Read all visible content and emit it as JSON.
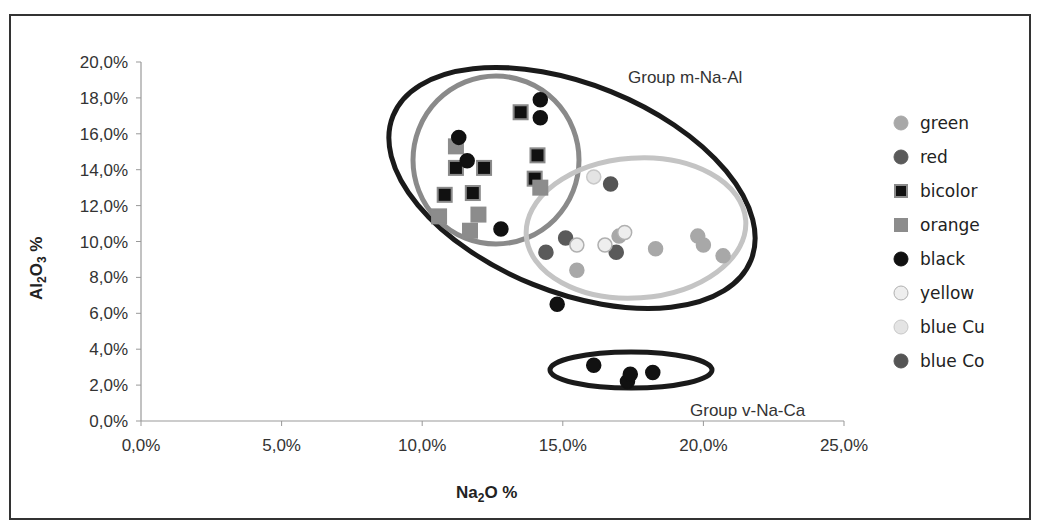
{
  "chart_data": {
    "type": "scatter",
    "title": "",
    "xlabel": "Na2O %",
    "ylabel": "Al2O3 %",
    "xlim": [
      0,
      25
    ],
    "ylim": [
      0,
      20
    ],
    "x_ticks": [
      "0,0%",
      "5,0%",
      "10,0%",
      "15,0%",
      "20,0%",
      "25,0%"
    ],
    "y_ticks": [
      "0,0%",
      "2,0%",
      "4,0%",
      "6,0%",
      "8,0%",
      "10,0%",
      "12,0%",
      "14,0%",
      "16,0%",
      "18,0%",
      "20,0%"
    ],
    "grid": false,
    "legend_position": "right",
    "series": [
      {
        "name": "green",
        "marker": "circle",
        "color": "#a8a8a8",
        "stroke": "#a8a8a8",
        "points": [
          [
            15.5,
            8.4
          ],
          [
            18.3,
            9.6
          ],
          [
            19.8,
            10.3
          ],
          [
            20.0,
            9.8
          ],
          [
            20.7,
            9.2
          ],
          [
            17.0,
            10.3
          ]
        ]
      },
      {
        "name": "red",
        "marker": "circle",
        "color": "#5a5a5a",
        "stroke": "#5a5a5a",
        "points": [
          [
            14.4,
            9.4
          ],
          [
            15.1,
            10.2
          ],
          [
            16.9,
            9.4
          ]
        ]
      },
      {
        "name": "bicolor",
        "marker": "square",
        "color": "#111111",
        "stroke": "#8a8a8a",
        "points": [
          [
            13.5,
            17.2
          ],
          [
            11.2,
            14.1
          ],
          [
            12.2,
            14.1
          ],
          [
            10.8,
            12.6
          ],
          [
            11.8,
            12.7
          ],
          [
            14.1,
            14.8
          ],
          [
            14.0,
            13.5
          ]
        ]
      },
      {
        "name": "orange",
        "marker": "square",
        "color": "#8c8c8c",
        "stroke": "#8c8c8c",
        "points": [
          [
            11.2,
            15.3
          ],
          [
            10.6,
            11.4
          ],
          [
            12.0,
            11.5
          ],
          [
            11.7,
            10.6
          ],
          [
            14.2,
            13.0
          ]
        ]
      },
      {
        "name": "black",
        "marker": "circle",
        "color": "#111111",
        "stroke": "#111111",
        "points": [
          [
            14.2,
            17.9
          ],
          [
            14.2,
            16.9
          ],
          [
            11.3,
            15.8
          ],
          [
            11.6,
            14.5
          ],
          [
            12.8,
            10.7
          ],
          [
            14.8,
            6.5
          ],
          [
            16.1,
            3.1
          ],
          [
            17.3,
            2.2
          ],
          [
            17.4,
            2.6
          ],
          [
            18.2,
            2.7
          ]
        ]
      },
      {
        "name": "yellow",
        "marker": "circle",
        "color": "#eeeeee",
        "stroke": "#b0b0b0",
        "points": [
          [
            15.5,
            9.8
          ],
          [
            16.5,
            9.8
          ],
          [
            17.2,
            10.5
          ]
        ]
      },
      {
        "name": "blue Cu",
        "marker": "circle",
        "color": "#e4e4e4",
        "stroke": "#c8c8c8",
        "points": [
          [
            16.1,
            13.6
          ]
        ]
      },
      {
        "name": "blue Co",
        "marker": "circle",
        "color": "#555555",
        "stroke": "#555555",
        "points": [
          [
            16.7,
            13.2
          ]
        ]
      }
    ],
    "groups": [
      {
        "label": "Group m-Na-Al",
        "shape": "ellipse",
        "color": "#111111",
        "cx": 19.5,
        "cy": 12.8
      },
      {
        "label": "Group v-Na-Ca",
        "shape": "ellipse",
        "color": "#111111"
      }
    ],
    "annotations": [
      "Group m-Na-Al",
      "Group v-Na-Ca"
    ]
  },
  "axis": {
    "x_title_main": "Na",
    "x_title_sub": "2",
    "x_title_rest": "O %",
    "y_title_main": "Al",
    "y_title_sub": "2",
    "y_title_mid": "O",
    "y_title_sub2": "3",
    "y_title_rest": " %"
  },
  "labels": {
    "group_m": "Group m-Na-Al",
    "group_v": "Group v-Na-Ca"
  }
}
